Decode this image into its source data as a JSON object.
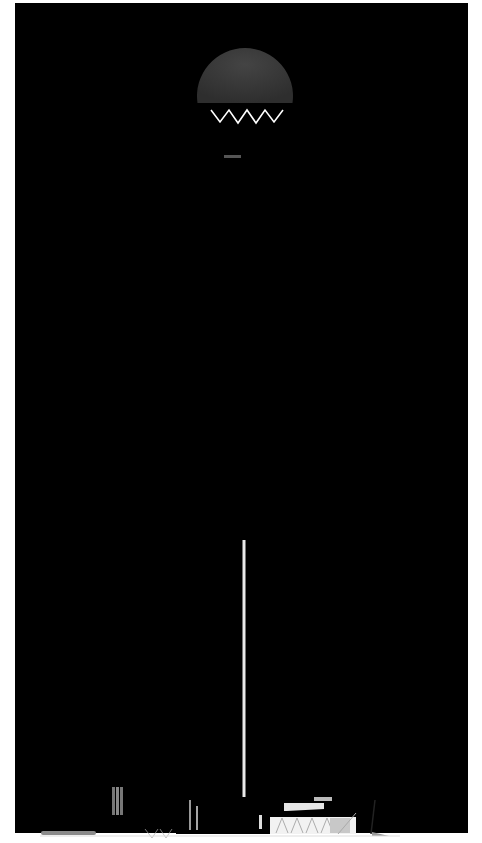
{
  "drawing": {
    "subject": "Tower elevation rendering",
    "description": "Tall rectangular tower with a tapering V-shaped cut-out and a suspended circular sky-bridge opening near the top, flanked by low podium structures at the base.",
    "floor_count_visual": 190,
    "colors": {
      "sky_top": "#2c2c2c",
      "sky_mid": "#9c9c9c",
      "sky_bottom": "#ffffff",
      "left_face": "#9a9a9a",
      "left_face_line": "#e6e6e6",
      "right_face": "#1e1e1e",
      "right_face_line": "#8a8a8a",
      "void": "#fbfbfb",
      "void_edge": "#555555",
      "circle": "#3a3a3a",
      "bridge": "#dcdcdc",
      "truss": "#555555",
      "podium_left": "#8a8a8a",
      "podium_right": "#101010",
      "canopy": "#6a6a6a"
    }
  }
}
